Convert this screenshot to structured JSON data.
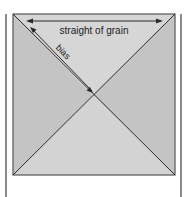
{
  "diagram": {
    "labels": {
      "straight_grain": "straight of grain",
      "bias": "bias"
    },
    "colors": {
      "fabric_side": "#c4c4c4",
      "fabric_top_bottom": "#d3d3d3",
      "lines": "#2a2a2a",
      "side_bars": "#8a8a8a"
    }
  }
}
